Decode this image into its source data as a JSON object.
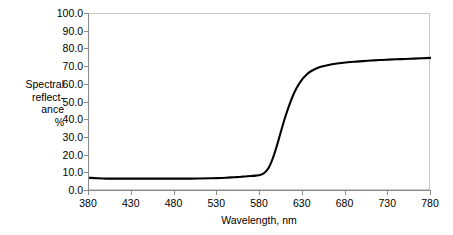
{
  "chart_data": {
    "type": "line",
    "title": "",
    "subtitle": "",
    "xlabel": "Wavelength, nm",
    "ylabel": "Spectral reflect-ance %",
    "ylabel_lines": [
      "Spectral",
      "reflect-",
      "ance",
      "%"
    ],
    "xlim": [
      380,
      780
    ],
    "ylim": [
      0,
      100
    ],
    "xtick_labels": [
      "380",
      "430",
      "480",
      "530",
      "580",
      "630",
      "680",
      "730",
      "780"
    ],
    "xticks": [
      380,
      430,
      480,
      530,
      580,
      630,
      680,
      730,
      780
    ],
    "ytick_labels": [
      "0.0",
      "10.0",
      "20.0",
      "30.0",
      "40.0",
      "50.0",
      "60.0",
      "70.0",
      "80.0",
      "90.0",
      "100.0"
    ],
    "yticks": [
      0,
      10,
      20,
      30,
      40,
      50,
      60,
      70,
      80,
      90,
      100
    ],
    "grid": false,
    "legend": false,
    "legend_position": "none",
    "line_color": "#000000",
    "line_width": 2.1,
    "plot_border_color": "#c9c9c9",
    "axis_color": "#8a8a8a",
    "background_color": "#ffffff",
    "series": [
      {
        "name": "Spectral reflectance",
        "x": [
          380,
          390,
          400,
          410,
          420,
          430,
          440,
          450,
          460,
          470,
          480,
          490,
          500,
          510,
          520,
          530,
          540,
          550,
          555,
          560,
          565,
          570,
          575,
          580,
          585,
          590,
          595,
          600,
          605,
          610,
          615,
          620,
          625,
          630,
          635,
          640,
          650,
          660,
          670,
          680,
          690,
          700,
          710,
          720,
          730,
          740,
          750,
          760,
          770,
          780
        ],
        "y": [
          7.5,
          7.2,
          7.0,
          7.0,
          7.0,
          7.0,
          7.0,
          7.0,
          7.0,
          7.0,
          7.0,
          7.0,
          7.0,
          7.1,
          7.2,
          7.3,
          7.5,
          7.8,
          7.9,
          8.1,
          8.3,
          8.5,
          8.7,
          9.0,
          10.2,
          13.0,
          18.5,
          26.0,
          34.5,
          42.5,
          49.5,
          55.5,
          60.0,
          63.5,
          66.0,
          67.8,
          70.0,
          71.2,
          72.0,
          72.6,
          73.0,
          73.4,
          73.7,
          74.0,
          74.2,
          74.4,
          74.6,
          74.8,
          75.0,
          75.2
        ]
      }
    ]
  },
  "axis_titles": {
    "x": "Wavelength, nm"
  }
}
